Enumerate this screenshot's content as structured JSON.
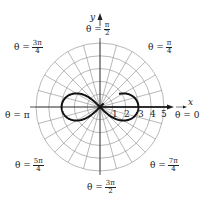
{
  "figure": {
    "type": "polar graph",
    "curve": "lemniscate",
    "center_px": [
      100,
      107
    ],
    "px_per_unit": 12.8,
    "max_radius": 5,
    "radial_line_step_deg": 15,
    "colors": {
      "grid": "#8a8a8a",
      "curve": "#111111",
      "axis": "#222222",
      "background": "#ffffff"
    }
  },
  "axes": {
    "x_label": "x",
    "y_label": "y",
    "x_ticks": [
      "1",
      "2",
      "3",
      "4",
      "5"
    ]
  },
  "angle_labels": [
    {
      "id": "pi_over_2",
      "prefix": "θ =",
      "num": "π",
      "den": "2"
    },
    {
      "id": "pi_over_4",
      "prefix": "θ =",
      "num": "π",
      "den": "4"
    },
    {
      "id": "three_pi_over_4",
      "prefix": "θ =",
      "num": "3π",
      "den": "4"
    },
    {
      "id": "pi",
      "text": "θ = π"
    },
    {
      "id": "zero",
      "text": "θ = 0"
    },
    {
      "id": "five_pi_over_4",
      "prefix": "θ =",
      "num": "5π",
      "den": "4"
    },
    {
      "id": "seven_pi_over_4",
      "prefix": "θ =",
      "num": "7π",
      "den": "4"
    },
    {
      "id": "three_pi_over_2",
      "prefix": "θ =",
      "num": "3π",
      "den": "2"
    }
  ]
}
